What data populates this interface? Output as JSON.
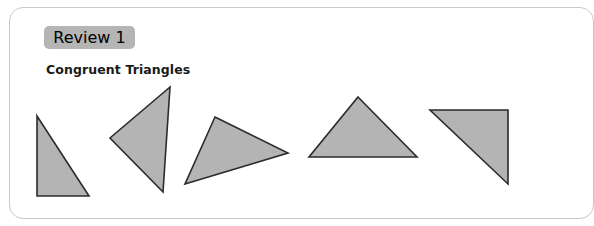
{
  "card": {
    "name": "worksheet-card"
  },
  "badge": {
    "label": "Review 1",
    "background_color": "#b5b5b5",
    "text_color": "#1a1a1a"
  },
  "title": {
    "text": "Congruent Triangles",
    "color": "#1a1a1a"
  },
  "figure": {
    "shape_fill_color": "#b4b4b4",
    "shape_stroke_color": "#2b2b2b",
    "count": 5,
    "shapes": [
      {
        "name": "triangle-1",
        "description": "right triangle, right angle at bottom-left",
        "points": "37,116 37,196 89,196"
      },
      {
        "name": "triangle-2",
        "description": "triangle pointing left",
        "points": "170,87 110,138 163,192"
      },
      {
        "name": "triangle-3",
        "description": "triangle tilted pointing right",
        "points": "215,117 288,153 185,184"
      },
      {
        "name": "triangle-4",
        "description": "upright triangle with horizontal base",
        "points": "358,97 417,157 309,157"
      },
      {
        "name": "triangle-5",
        "description": "right triangle, right angle at top-right",
        "points": "430,110 508,110 508,184"
      }
    ]
  }
}
